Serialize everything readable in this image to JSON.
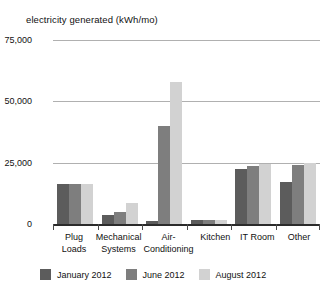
{
  "chart_data": {
    "type": "bar",
    "title": "electricity generated (kWh/mo)",
    "xlabel": "",
    "ylabel": "electricity generated (kWh/mo)",
    "ylim": [
      0,
      75000
    ],
    "yticks": [
      0,
      25000,
      50000,
      75000
    ],
    "ytick_labels": [
      "0",
      "25,000",
      "50,000",
      "75,000"
    ],
    "grid": true,
    "legend_position": "bottom",
    "categories": [
      "Plug Loads",
      "Mechanical Systems",
      "Air-Conditioning",
      "Kitchen",
      "IT Room",
      "Other"
    ],
    "category_lines": [
      [
        "Plug",
        "Loads"
      ],
      [
        "Mechanical",
        "Systems"
      ],
      [
        "Air-",
        "Conditioning"
      ],
      [
        "Kitchen",
        ""
      ],
      [
        "IT Room",
        ""
      ],
      [
        "Other",
        ""
      ]
    ],
    "series": [
      {
        "name": "January 2012",
        "color": "#5c5c5c",
        "values": [
          16500,
          3700,
          1200,
          1800,
          22500,
          17000
        ]
      },
      {
        "name": "June 2012",
        "color": "#7e7e7e",
        "values": [
          16500,
          5000,
          40000,
          1800,
          23500,
          24000
        ]
      },
      {
        "name": "August 2012",
        "color": "#d2d2d2",
        "values": [
          16500,
          8600,
          58000,
          1800,
          24500,
          25000
        ]
      }
    ]
  },
  "colors": {
    "january": "#5c5c5c",
    "june": "#7e7e7e",
    "august": "#d2d2d2",
    "gridline": "#b0b0b0",
    "axis": "#2b2b2b",
    "text": "#111111",
    "background": "#ffffff"
  }
}
